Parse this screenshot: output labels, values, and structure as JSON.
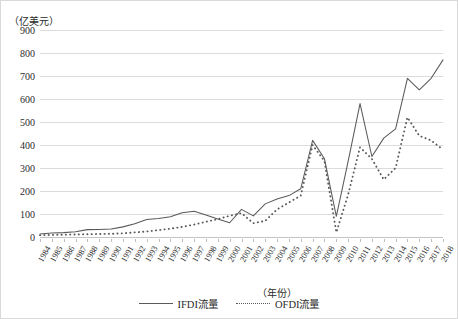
{
  "axes": {
    "y_unit_label": "（亿美元）",
    "x_unit_label": "（年份）"
  },
  "legend": {
    "items": [
      {
        "label": "IFDI流量",
        "style": "solid",
        "color": "#5a5a5a"
      },
      {
        "label": "OFDI流量",
        "style": "dotted",
        "color": "#5a5a5a"
      }
    ]
  },
  "chart_data": {
    "type": "line",
    "title": "",
    "xlabel": "（年份）",
    "ylabel": "（亿美元）",
    "ylim": [
      0,
      900
    ],
    "ytick_step": 100,
    "yticks": [
      0,
      100,
      200,
      300,
      400,
      500,
      600,
      700,
      800,
      900
    ],
    "grid": true,
    "legend_position": "bottom",
    "categories": [
      "1984",
      "1985",
      "1986",
      "1987",
      "1988",
      "1989",
      "1990",
      "1991",
      "1992",
      "1993",
      "1994",
      "1995",
      "1996",
      "1997",
      "1998",
      "1999",
      "2000",
      "2001",
      "2002",
      "2003",
      "2004",
      "2005",
      "2006",
      "2007",
      "2008",
      "2009",
      "2010",
      "2011",
      "2012",
      "2013",
      "2014",
      "2015",
      "2016",
      "2017",
      "2018"
    ],
    "series": [
      {
        "name": "IFDI流量",
        "style": "solid",
        "color": "#5a5a5a",
        "values": [
          13,
          17,
          19,
          23,
          32,
          33,
          35,
          44,
          58,
          76,
          80,
          88,
          105,
          112,
          96,
          78,
          62,
          120,
          92,
          144,
          165,
          180,
          210,
          420,
          340,
          90,
          330,
          580,
          350,
          430,
          470,
          690,
          640,
          690,
          770
        ]
      },
      {
        "name": "OFDI流量",
        "style": "dotted",
        "color": "#5a5a5a",
        "values": [
          8,
          9,
          10,
          11,
          12,
          13,
          14,
          16,
          20,
          24,
          30,
          36,
          44,
          54,
          66,
          78,
          92,
          104,
          60,
          70,
          120,
          150,
          180,
          400,
          330,
          20,
          185,
          390,
          340,
          250,
          300,
          520,
          440,
          420,
          380
        ]
      }
    ]
  }
}
